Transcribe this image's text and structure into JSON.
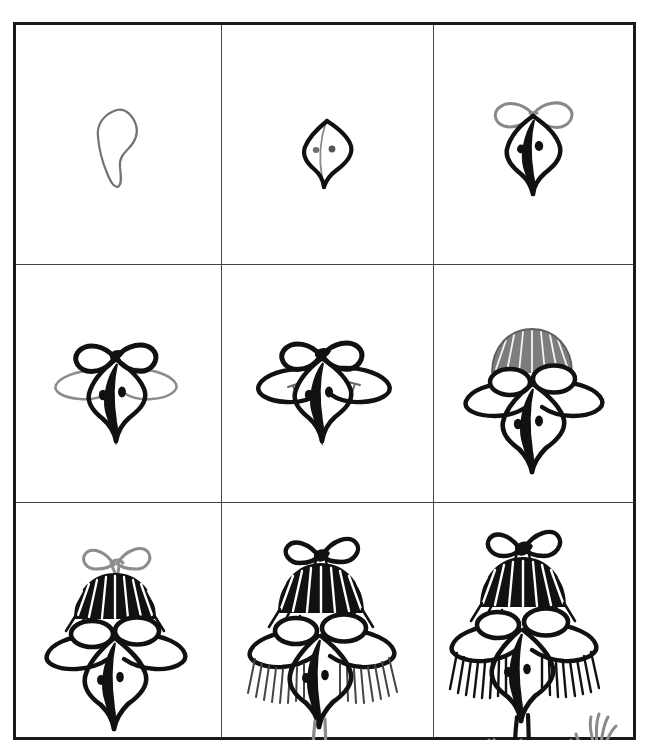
{
  "page": {
    "kind": "drawing-tutorial-sheet",
    "background_color": "#ffffff",
    "border_color": "#1a1a1a",
    "ink_color": "#111111",
    "pencil_color": "#737373",
    "grid": {
      "rows": 3,
      "columns": 3,
      "frame": {
        "x": 13,
        "y": 22,
        "width": 623,
        "height": 718
      },
      "vertical_dividers_x": [
        221,
        433
      ],
      "horizontal_dividers_y": [
        264,
        502
      ],
      "outer_border_width": 3,
      "divider_width": 1
    },
    "panels": [
      {
        "index": 1,
        "row": 1,
        "column": 1,
        "step_label": "1",
        "name": "step-1-head-guide",
        "description": "Light pencil outline of a leaf/teardrop head shape",
        "stroke_style": "pencil",
        "elements": [
          "head-outline-guide"
        ]
      },
      {
        "index": 2,
        "row": 1,
        "column": 2,
        "step_label": "2",
        "name": "step-2-inked-head-and-eyes",
        "description": "Head outline inked black with pencil centre line and two small eye dots",
        "stroke_style": "ink+pencil",
        "elements": [
          "head-outline-ink",
          "centre-line-guide",
          "eye-dot-left",
          "eye-dot-right"
        ]
      },
      {
        "index": 3,
        "row": 1,
        "column": 3,
        "step_label": "3",
        "name": "step-3-beak-and-bow-guide",
        "description": "Beak inked solid, black eyes added, pencil bow sketched on top of head",
        "stroke_style": "ink+pencil",
        "elements": [
          "head-outline-ink",
          "beak-ink",
          "eye-left",
          "eye-right",
          "bow-guide"
        ]
      },
      {
        "index": 4,
        "row": 2,
        "column": 1,
        "step_label": "4",
        "name": "step-4-inked-bow-and-wing-guides",
        "description": "Bow inked black; pencil guide lines for side wings / cheeks sweep out left and right",
        "stroke_style": "ink+pencil",
        "elements": [
          "head-ink",
          "beak-ink",
          "bow-ink",
          "wing-guide-left",
          "wing-guide-right"
        ]
      },
      {
        "index": 5,
        "row": 2,
        "column": 2,
        "step_label": "5",
        "name": "step-5-inked-wings",
        "description": "Side wing / cheek shapes inked black on both sides of the head",
        "stroke_style": "ink",
        "elements": [
          "head-ink",
          "beak-ink",
          "bow-ink",
          "wing-left-ink",
          "wing-right-ink"
        ]
      },
      {
        "index": 6,
        "row": 2,
        "column": 3,
        "step_label": "6",
        "name": "step-6-hair-cap-guide",
        "description": "Pencil striped dome of hair added on top of head, eyelid ovals drawn over the eyes",
        "stroke_style": "ink+pencil",
        "elements": [
          "hair-cap-guide",
          "eyelid-left",
          "eyelid-right",
          "head-ink",
          "beak-ink",
          "wings-ink"
        ]
      },
      {
        "index": 7,
        "row": 3,
        "column": 1,
        "step_label": "7",
        "name": "step-7-inked-hair-pencil-bow",
        "description": "Hair cap inked with radiating strokes; pencil bow re-drawn above the hair",
        "stroke_style": "ink+pencil",
        "elements": [
          "hair-ink",
          "bow-guide-top",
          "eyelid-left",
          "eyelid-right",
          "head-ink",
          "beak-ink",
          "wings-ink"
        ]
      },
      {
        "index": 8,
        "row": 3,
        "column": 2,
        "step_label": "8",
        "name": "step-8-feather-fringe-and-neck-guide",
        "description": "Top bow inked; feather fringe strokes hang from both wings; pencil neck curves down to a hooked foot",
        "stroke_style": "ink+pencil",
        "elements": [
          "bow-ink",
          "hair-ink",
          "eyelids",
          "head-ink",
          "beak-ink",
          "fringe-left",
          "fringe-right",
          "neck-guide",
          "foot-hook-guide"
        ]
      },
      {
        "index": 9,
        "row": 3,
        "column": 3,
        "step_label": "9",
        "name": "step-9-full-figure",
        "description": "Finished character: inked head, bow, hair, feather fringe and long neck, with pencil body, shoulders and two raised arms with splayed hands",
        "stroke_style": "ink+pencil",
        "elements": [
          "bow-ink",
          "hair-ink",
          "eyelids",
          "eyes",
          "head-ink",
          "beak-ink",
          "fringe-left",
          "fringe-right",
          "neck-ink",
          "collar",
          "body-guide",
          "arm-left-guide",
          "hand-left-guide",
          "arm-right-guide",
          "hand-right-guide"
        ]
      }
    ]
  }
}
